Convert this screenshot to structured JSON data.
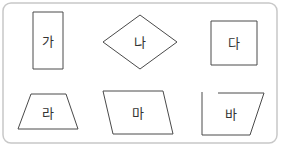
{
  "figure": {
    "frame": {
      "x": 3,
      "y": 3,
      "width": 274,
      "height": 140,
      "radius": 8,
      "stroke": "#c8c8c8"
    },
    "shapes": [
      {
        "id": "ga",
        "label": "가",
        "type": "rectangle",
        "points": "33,12 63,12 63,69 33,69",
        "label_x": 48,
        "label_y": 41
      },
      {
        "id": "na",
        "label": "나",
        "type": "rhombus",
        "points": "103,42 140,15 177,42 140,69",
        "label_x": 140,
        "label_y": 42
      },
      {
        "id": "da",
        "label": "다",
        "type": "square",
        "points": "211,21 257,21 257,65 211,65",
        "label_x": 234,
        "label_y": 43
      },
      {
        "id": "ra",
        "label": "라",
        "type": "trapezoid",
        "points": "31,94 66,94 78,129 18,129",
        "label_x": 48,
        "label_y": 113
      },
      {
        "id": "ma",
        "label": "마",
        "type": "parallelogram",
        "points": "103,91 163,91 173,134 113,134",
        "label_x": 138,
        "label_y": 113
      },
      {
        "id": "ba",
        "label": "바",
        "type": "open-quadrilateral",
        "path": "M202,92 L202,135 L250,135 L264,93 L218,93",
        "label_x": 231,
        "label_y": 114
      }
    ],
    "colors": {
      "stroke": "#4a4a4a",
      "text": "#333333",
      "background": "#ffffff"
    }
  }
}
